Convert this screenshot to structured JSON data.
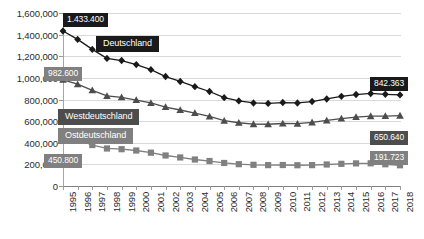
{
  "chart_data": {
    "type": "line",
    "title": "",
    "xlabel": "",
    "ylabel": "",
    "ylim": [
      0,
      1600000
    ],
    "ytick_values": [
      0,
      200000,
      400000,
      600000,
      800000,
      1000000,
      1200000,
      1400000,
      1600000
    ],
    "ytick_labels": [
      "0",
      "200,000",
      "400,000",
      "600,000",
      "800,000",
      "1,000,000",
      "1,200,000",
      "1,400,000",
      "1,600,000"
    ],
    "grid": true,
    "legend_position": "inline-annotations",
    "categories": [
      "1995",
      "1996",
      "1997",
      "1998",
      "1999",
      "2000",
      "2001",
      "2002",
      "2003",
      "2004",
      "2005",
      "2006",
      "2007",
      "2008",
      "2009",
      "2010",
      "2011",
      "2012",
      "2013",
      "2014",
      "2015",
      "2016",
      "2017",
      "2018"
    ],
    "series": [
      {
        "name": "Deutschland",
        "marker": "diamond",
        "color": "#1a1a1a",
        "values": [
          1433400,
          1355900,
          1263400,
          1180100,
          1160300,
          1122800,
          1076000,
          1012200,
          967000,
          919000,
          874000,
          817000,
          787000,
          768000,
          764000,
          772000,
          768000,
          781000,
          805000,
          829000,
          846000,
          856000,
          848000,
          842363
        ]
      },
      {
        "name": "Westdeutschland",
        "marker": "triangle",
        "color": "#4d4d4d",
        "values": [
          982600,
          941600,
          884500,
          833000,
          819900,
          794600,
          767800,
          730000,
          703000,
          674000,
          643000,
          604000,
          585000,
          572000,
          571000,
          578000,
          576000,
          588000,
          606000,
          624000,
          637000,
          646000,
          647000,
          650640
        ]
      },
      {
        "name": "Ostdeutschland",
        "marker": "square",
        "color": "#808080",
        "values": [
          450800,
          430300,
          378900,
          347100,
          340400,
          328200,
          308200,
          282200,
          264000,
          245000,
          231000,
          213000,
          202000,
          196000,
          193000,
          194000,
          192000,
          193000,
          199000,
          205000,
          209000,
          210000,
          201000,
          191723
        ]
      }
    ],
    "annotations": [
      {
        "id": "start-deutschland",
        "label": "1.433.400",
        "style": "black",
        "series": "Deutschland",
        "point": "1995"
      },
      {
        "id": "start-westdeutschland",
        "label": "982.600",
        "style": "midgray",
        "series": "Westdeutschland",
        "point": "1995"
      },
      {
        "id": "start-ostdeutschland",
        "label": "450.800",
        "style": "midgray",
        "series": "Ostdeutschland",
        "point": "1995"
      },
      {
        "id": "end-deutschland",
        "label": "842.363",
        "style": "black",
        "series": "Deutschland",
        "point": "2018"
      },
      {
        "id": "end-westdeutschland",
        "label": "650.640",
        "style": "darkgray",
        "series": "Westdeutschland",
        "point": "2018"
      },
      {
        "id": "end-ostdeutschland",
        "label": "191.723",
        "style": "midgray",
        "series": "Ostdeutschland",
        "point": "2018"
      },
      {
        "id": "name-deutschland",
        "label": "Deutschland",
        "style": "black",
        "series": "Deutschland"
      },
      {
        "id": "name-westdeutschland",
        "label": "Westdeutschland",
        "style": "darkgray",
        "series": "Westdeutschland"
      },
      {
        "id": "name-ostdeutschland",
        "label": "Ostdeutschland",
        "style": "midgray",
        "series": "Ostdeutschland"
      }
    ]
  }
}
